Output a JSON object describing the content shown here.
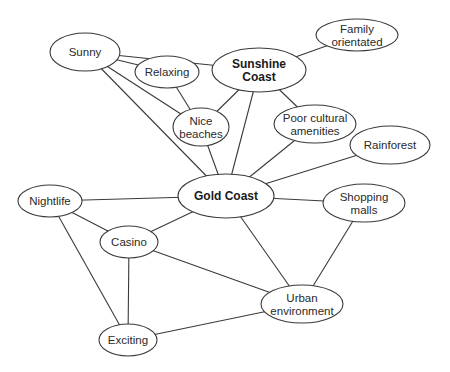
{
  "diagram": {
    "type": "concept-map",
    "nodes": [
      {
        "id": "sunny",
        "lines": [
          "Sunny"
        ],
        "cx": 85,
        "cy": 52,
        "rx": 35,
        "ry": 19,
        "bold": false
      },
      {
        "id": "relaxing",
        "lines": [
          "Relaxing"
        ],
        "cx": 167,
        "cy": 72,
        "rx": 32,
        "ry": 16,
        "bold": false
      },
      {
        "id": "sunshine-coast",
        "lines": [
          "Sunshine",
          "Coast"
        ],
        "cx": 259,
        "cy": 70,
        "rx": 47,
        "ry": 22,
        "bold": true
      },
      {
        "id": "family-orientated",
        "lines": [
          "Family",
          "orientated"
        ],
        "cx": 357,
        "cy": 35,
        "rx": 41,
        "ry": 16,
        "bold": false
      },
      {
        "id": "nice-beaches",
        "lines": [
          "Nice",
          "beaches"
        ],
        "cx": 201,
        "cy": 127,
        "rx": 28,
        "ry": 19,
        "bold": false
      },
      {
        "id": "poor-cultural-amenities",
        "lines": [
          "Poor cultural",
          "amenities"
        ],
        "cx": 315,
        "cy": 124,
        "rx": 41,
        "ry": 19,
        "bold": false
      },
      {
        "id": "rainforest",
        "lines": [
          "Rainforest"
        ],
        "cx": 390,
        "cy": 145,
        "rx": 40,
        "ry": 19,
        "bold": false
      },
      {
        "id": "gold-coast",
        "lines": [
          "Gold Coast"
        ],
        "cx": 226,
        "cy": 196,
        "rx": 48,
        "ry": 22,
        "bold": true
      },
      {
        "id": "nightlife",
        "lines": [
          "Nightlife"
        ],
        "cx": 50,
        "cy": 201,
        "rx": 32,
        "ry": 16,
        "bold": false
      },
      {
        "id": "casino",
        "lines": [
          "Casino"
        ],
        "cx": 129,
        "cy": 242,
        "rx": 29,
        "ry": 16,
        "bold": false
      },
      {
        "id": "shopping-malls",
        "lines": [
          "Shopping",
          "malls"
        ],
        "cx": 364,
        "cy": 203,
        "rx": 41,
        "ry": 19,
        "bold": false
      },
      {
        "id": "urban-environment",
        "lines": [
          "Urban",
          "environment"
        ],
        "cx": 302,
        "cy": 304,
        "rx": 41,
        "ry": 19,
        "bold": false
      },
      {
        "id": "exciting",
        "lines": [
          "Exciting"
        ],
        "cx": 128,
        "cy": 340,
        "rx": 29,
        "ry": 16,
        "bold": false
      }
    ],
    "edges": [
      {
        "from": "sunny",
        "to": "sunshine-coast"
      },
      {
        "from": "sunny",
        "to": "relaxing"
      },
      {
        "from": "sunny",
        "to": "nice-beaches"
      },
      {
        "from": "sunny",
        "to": "gold-coast"
      },
      {
        "from": "relaxing",
        "to": "nice-beaches"
      },
      {
        "from": "sunshine-coast",
        "to": "family-orientated"
      },
      {
        "from": "sunshine-coast",
        "to": "nice-beaches"
      },
      {
        "from": "sunshine-coast",
        "to": "poor-cultural-amenities"
      },
      {
        "from": "sunshine-coast",
        "to": "gold-coast"
      },
      {
        "from": "nice-beaches",
        "to": "gold-coast"
      },
      {
        "from": "poor-cultural-amenities",
        "to": "gold-coast"
      },
      {
        "from": "rainforest",
        "to": "gold-coast"
      },
      {
        "from": "gold-coast",
        "to": "nightlife"
      },
      {
        "from": "gold-coast",
        "to": "casino"
      },
      {
        "from": "gold-coast",
        "to": "shopping-malls"
      },
      {
        "from": "gold-coast",
        "to": "urban-environment"
      },
      {
        "from": "nightlife",
        "to": "casino"
      },
      {
        "from": "nightlife",
        "to": "exciting"
      },
      {
        "from": "casino",
        "to": "exciting"
      },
      {
        "from": "casino",
        "to": "urban-environment"
      },
      {
        "from": "exciting",
        "to": "urban-environment"
      },
      {
        "from": "shopping-malls",
        "to": "urban-environment"
      }
    ]
  }
}
